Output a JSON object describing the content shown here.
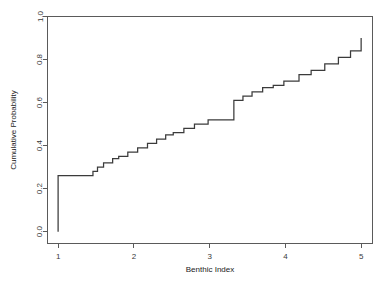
{
  "chart_data": {
    "type": "line",
    "subtype": "ecdf-step",
    "title": "",
    "xlabel": "Benthic Index",
    "ylabel": "Cumulative Probability",
    "xlim": [
      0.86,
      5.15
    ],
    "ylim": [
      -0.055,
      1.0
    ],
    "grid": false,
    "legend": null,
    "xticks": [
      1,
      2,
      3,
      4,
      5
    ],
    "xtick_labels": [
      "1",
      "2",
      "3",
      "4",
      "5"
    ],
    "yticks": [
      0.0,
      0.2,
      0.4,
      0.6,
      0.8,
      1.0
    ],
    "ytick_labels": [
      "0.0",
      "0.2",
      "0.4",
      "0.6",
      "0.8",
      "1.0"
    ],
    "line_color": "#3b3b3b",
    "axis_color": "#5a5a5a",
    "series": [
      {
        "name": "Cumulative Probability",
        "x": [
          1.0,
          1.0,
          1.38,
          1.46,
          1.52,
          1.6,
          1.72,
          1.8,
          1.92,
          2.05,
          2.18,
          2.3,
          2.42,
          2.52,
          2.66,
          2.8,
          2.98,
          3.0,
          3.32,
          3.44,
          3.56,
          3.7,
          3.84,
          3.98,
          4.0,
          4.18,
          4.34,
          4.52,
          4.7,
          4.86,
          5.0,
          5.0
        ],
        "y": [
          0.0,
          0.26,
          0.26,
          0.28,
          0.3,
          0.32,
          0.34,
          0.35,
          0.37,
          0.39,
          0.41,
          0.43,
          0.45,
          0.46,
          0.48,
          0.5,
          0.52,
          0.52,
          0.61,
          0.63,
          0.65,
          0.67,
          0.68,
          0.7,
          0.7,
          0.73,
          0.75,
          0.78,
          0.81,
          0.84,
          0.86,
          0.9
        ]
      }
    ],
    "annotations": [
      "Vertical rise at x=1 from 0.00 to 0.26",
      "Long plateau at y=0.26 from x=1.00 to x=1.38",
      "Plateau at y=0.52 from x=2.98 to x=3.32",
      "Final vertical rise at x=5 from 0.86 to 0.90"
    ]
  }
}
